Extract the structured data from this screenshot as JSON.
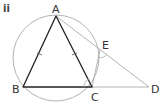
{
  "part_label": "ii",
  "points": {
    "A": {
      "label": "A",
      "x": 56,
      "y": 16
    },
    "B": {
      "label": "B",
      "x": 23,
      "y": 87
    },
    "C": {
      "label": "C",
      "x": 92,
      "y": 87
    },
    "D": {
      "label": "D",
      "x": 149,
      "y": 87
    },
    "E": {
      "label": "E",
      "x": 101,
      "y": 49
    }
  },
  "circle": {
    "cx": 56,
    "cy": 58,
    "r": 43
  },
  "colors": {
    "triangle": "#222222",
    "construction": "#aaaaaa",
    "label": "#333333"
  }
}
